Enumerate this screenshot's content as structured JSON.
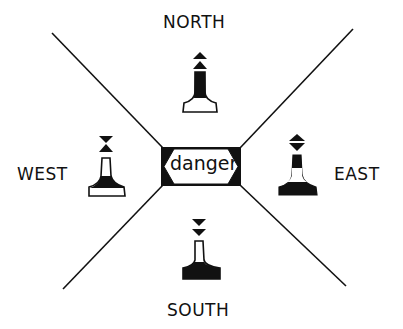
{
  "diagram": {
    "center": {
      "label": "danger"
    },
    "directions": [
      {
        "label": "NORTH",
        "topmark": "two cones pointing up",
        "body": "black over white"
      },
      {
        "label": "EAST",
        "topmark": "two cones base to base",
        "body": "black with white band"
      },
      {
        "label": "SOUTH",
        "topmark": "two cones pointing down",
        "body": "white over black"
      },
      {
        "label": "WEST",
        "topmark": "two cones point to point",
        "body": "white with black band"
      }
    ]
  },
  "colors": {
    "ink": "#111111",
    "background": "#ffffff"
  }
}
